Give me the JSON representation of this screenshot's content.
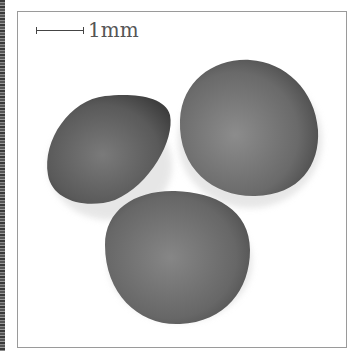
{
  "image": {
    "subject": "three seeds photographed on white background",
    "scale_bar": {
      "label": "1mm"
    },
    "colors": {
      "seed": "#6e6e6e",
      "background": "#ffffff",
      "frame": "#9a9a9a"
    }
  }
}
